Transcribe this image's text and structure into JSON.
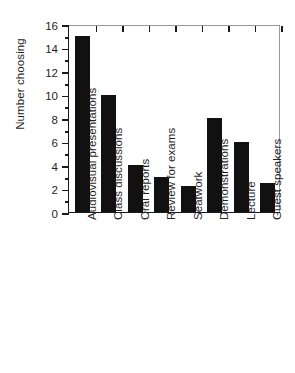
{
  "chart_data": {
    "type": "bar",
    "title": "",
    "xlabel": "",
    "ylabel": "Number choosing",
    "ylim": [
      0,
      16
    ],
    "ytick_step": 2,
    "yticks": [
      0,
      2,
      4,
      6,
      8,
      10,
      12,
      14,
      16
    ],
    "ytick_labels": [
      "0",
      "2",
      "4",
      "6",
      "8",
      "10",
      "12",
      "14",
      "16"
    ],
    "minor_ticks": [
      1,
      3,
      5,
      7,
      9,
      11,
      13,
      15
    ],
    "grid": false,
    "legend": null,
    "orientation": "vertical",
    "bar_color": "#111111",
    "categories": [
      "Audiovisual presentations",
      "Class discussions",
      "Oral reports",
      "Review for exams",
      "Seatwork",
      "Demonstrations",
      "Lecture",
      "Guest speakers"
    ],
    "values": [
      15,
      10,
      4,
      3,
      2.2,
      8,
      6,
      2.5
    ],
    "annotations": []
  },
  "axes": {
    "y_title": "Number choosing"
  },
  "colors": {
    "background": "#ffffff",
    "bar": "#111111",
    "axis": "#1a1a1a",
    "frame_light": "#9a9a9a",
    "text": "#1f1f1f"
  }
}
